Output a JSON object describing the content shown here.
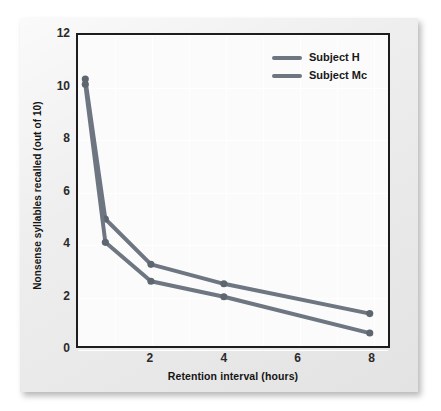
{
  "chart_data": {
    "type": "line",
    "title": "",
    "xlabel": "Retention interval (hours)",
    "ylabel": "Nonsense syllables recalled (out of 10)",
    "xlim": [
      0,
      8.5
    ],
    "ylim": [
      0,
      12
    ],
    "x_ticks": [
      2,
      4,
      6,
      8
    ],
    "y_ticks": [
      0,
      2,
      4,
      6,
      8,
      10,
      12
    ],
    "grid": true,
    "legend_position": "top-right",
    "series": [
      {
        "name": "Subject H",
        "color": "#6e7681",
        "x": [
          0.2,
          0.75,
          2,
          4,
          8
        ],
        "values": [
          10.3,
          4.9,
          3.15,
          2.4,
          1.25
        ]
      },
      {
        "name": "Subject Mc",
        "color": "#6e7681",
        "x": [
          0.2,
          0.75,
          2,
          4,
          8
        ],
        "values": [
          10.1,
          4.0,
          2.5,
          1.9,
          0.5
        ]
      }
    ]
  },
  "legend": {
    "items": [
      {
        "label": "Subject H"
      },
      {
        "label": "Subject Mc"
      }
    ]
  },
  "axes": {
    "x_tick_labels": [
      "2",
      "4",
      "6",
      "8"
    ],
    "y_tick_labels": [
      "0",
      "2",
      "4",
      "6",
      "8",
      "10",
      "12"
    ],
    "x_title": "Retention interval (hours)",
    "y_title": "Nonsense syllables recalled (out of 10)"
  },
  "colors": {
    "line": "#6e7681",
    "marker": "#5e6670",
    "card_background": "#ececec",
    "plot_background": "#fbfbfb",
    "axis": "#1d1d1d",
    "gridline": "#ffffff"
  }
}
